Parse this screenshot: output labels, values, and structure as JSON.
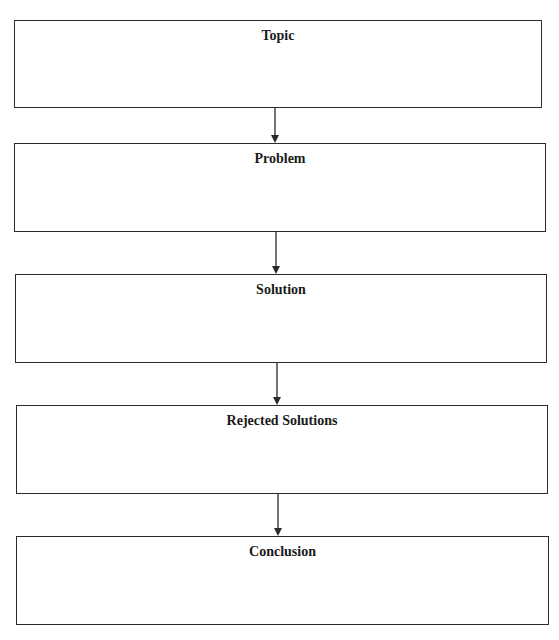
{
  "diagram": {
    "type": "vertical-flowchart",
    "boxes": [
      {
        "id": "topic",
        "label": "Topic"
      },
      {
        "id": "problem",
        "label": "Problem"
      },
      {
        "id": "solution",
        "label": "Solution"
      },
      {
        "id": "rejected",
        "label": "Rejected Solutions"
      },
      {
        "id": "conclusion",
        "label": "Conclusion"
      }
    ],
    "edges": [
      {
        "from": "Topic",
        "to": "Problem"
      },
      {
        "from": "Problem",
        "to": "Solution"
      },
      {
        "from": "Solution",
        "to": "Rejected Solutions"
      },
      {
        "from": "Rejected Solutions",
        "to": "Conclusion"
      }
    ],
    "colors": {
      "stroke": "#2a2a2a",
      "background": "#ffffff",
      "text": "#1a1a1a"
    }
  }
}
